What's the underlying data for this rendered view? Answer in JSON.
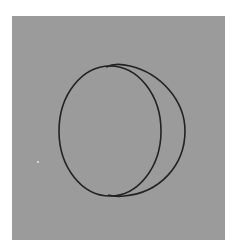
{
  "image": {
    "description": "Gray square panel with two overlapping circular outlines forming a crescent shape",
    "colors": {
      "background": "#ffffff",
      "panel": "#9b9b9b",
      "stroke": "#222222",
      "speck": "#d8d8d8"
    },
    "panel": {
      "x": 12,
      "y": 16,
      "width": 213,
      "height": 224
    },
    "shapes": [
      {
        "name": "left-circle",
        "cx": 110,
        "cy": 131,
        "rx": 51,
        "ry": 65
      },
      {
        "name": "right-arc",
        "from": [
          112,
          66
        ],
        "to": [
          112,
          196
        ],
        "rx": 63,
        "ry": 66
      }
    ]
  }
}
